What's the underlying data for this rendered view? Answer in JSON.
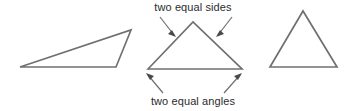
{
  "figure": {
    "background_color": "#ffffff",
    "stroke_color": "#707070",
    "arrow_color": "#4a4a4a",
    "text_color": "#2b2b2b",
    "labels": {
      "top": "two equal sides",
      "bottom": "two equal angles"
    },
    "shapes": [
      {
        "name": "scalene-triangle",
        "points": "20,67 131,30 116,67"
      },
      {
        "name": "isosceles-triangle",
        "points": "148,69 193,22 242,69"
      },
      {
        "name": "equilateral-triangle",
        "points": "270,67 303,11 337,67"
      }
    ],
    "annotations": [
      {
        "name": "arrow-top-left",
        "line": "160,17 174,35",
        "head": "176,37 168,34 172,30"
      },
      {
        "name": "arrow-top-right",
        "line": "232,17 218,35",
        "head": "216,37 220,30 224,34"
      },
      {
        "name": "arrow-bottom-left",
        "line": "163,93 148,75",
        "head": "146,73 154,76 150,80"
      },
      {
        "name": "arrow-bottom-right",
        "line": "224,93 240,75",
        "head": "242,73 238,80 234,76"
      }
    ]
  }
}
